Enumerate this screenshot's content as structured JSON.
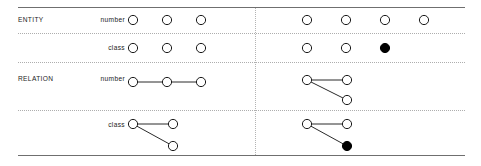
{
  "figure": {
    "width": 481,
    "height": 166,
    "background": "#ffffff",
    "line_color": "#6f6f6f",
    "separator_color": "#aeaeae",
    "node_stroke": "#1a1a1a",
    "node_fill_open": "#ffffff",
    "node_fill_closed": "#000000"
  },
  "rules": {
    "top": {
      "x": 18,
      "y": 7,
      "width": 447
    },
    "bottom": {
      "x": 18,
      "y": 155,
      "width": 447
    }
  },
  "separators": {
    "horizontal": [
      {
        "x": 18,
        "y": 33,
        "width": 447
      },
      {
        "x": 18,
        "y": 62,
        "width": 447
      },
      {
        "x": 18,
        "y": 110,
        "width": 447
      }
    ],
    "vertical": [
      {
        "x": 255,
        "y": 8,
        "height": 147
      }
    ]
  },
  "rows": [
    {
      "group_label": "ENTITY",
      "group_label_x": 18,
      "group_label_y": 17,
      "sub_label": "number",
      "sub_label_x": 80,
      "sub_label_y": 17,
      "sub_label_width": 45
    },
    {
      "group_label": "",
      "group_label_x": 18,
      "group_label_y": 45,
      "sub_label": "class",
      "sub_label_x": 80,
      "sub_label_y": 45,
      "sub_label_width": 45
    },
    {
      "group_label": "RELATION",
      "group_label_x": 18,
      "group_label_y": 76,
      "sub_label": "number",
      "sub_label_x": 80,
      "sub_label_y": 76,
      "sub_label_width": 45
    },
    {
      "group_label": "",
      "group_label_x": 18,
      "group_label_y": 122,
      "sub_label": "class",
      "sub_label_x": 80,
      "sub_label_y": 122,
      "sub_label_width": 45
    }
  ],
  "chart_data": {
    "type": "diagram",
    "title": "",
    "row_labels": [
      "ENTITY number",
      "ENTITY class",
      "RELATION number",
      "RELATION class"
    ],
    "column_labels": [
      "left",
      "right"
    ],
    "node_radius": 4.6,
    "cells": [
      {
        "row": "ENTITY number",
        "column": "left",
        "node_count": 3,
        "filled_count": 0,
        "edge_count": 0,
        "nodes": [
          {
            "cx": 133,
            "cy": 20,
            "filled": false
          },
          {
            "cx": 167,
            "cy": 20,
            "filled": false
          },
          {
            "cx": 201,
            "cy": 20,
            "filled": false
          }
        ],
        "edges": []
      },
      {
        "row": "ENTITY number",
        "column": "right",
        "node_count": 4,
        "filled_count": 0,
        "edge_count": 0,
        "nodes": [
          {
            "cx": 307,
            "cy": 20,
            "filled": false
          },
          {
            "cx": 346,
            "cy": 20,
            "filled": false
          },
          {
            "cx": 385,
            "cy": 20,
            "filled": false
          },
          {
            "cx": 424,
            "cy": 20,
            "filled": false
          }
        ],
        "edges": []
      },
      {
        "row": "ENTITY class",
        "column": "left",
        "node_count": 3,
        "filled_count": 0,
        "edge_count": 0,
        "nodes": [
          {
            "cx": 133,
            "cy": 48,
            "filled": false
          },
          {
            "cx": 167,
            "cy": 48,
            "filled": false
          },
          {
            "cx": 201,
            "cy": 48,
            "filled": false
          }
        ],
        "edges": []
      },
      {
        "row": "ENTITY class",
        "column": "right",
        "node_count": 3,
        "filled_count": 1,
        "edge_count": 0,
        "nodes": [
          {
            "cx": 307,
            "cy": 48,
            "filled": false
          },
          {
            "cx": 346,
            "cy": 48,
            "filled": false
          },
          {
            "cx": 385,
            "cy": 48,
            "filled": true
          }
        ],
        "edges": []
      },
      {
        "row": "RELATION number",
        "column": "left",
        "node_count": 3,
        "filled_count": 0,
        "edge_count": 2,
        "nodes": [
          {
            "cx": 133,
            "cy": 82,
            "filled": false
          },
          {
            "cx": 167,
            "cy": 82,
            "filled": false
          },
          {
            "cx": 201,
            "cy": 82,
            "filled": false
          }
        ],
        "edges": [
          {
            "from": 0,
            "to": 1
          },
          {
            "from": 1,
            "to": 2
          }
        ]
      },
      {
        "row": "RELATION number",
        "column": "right",
        "node_count": 3,
        "filled_count": 0,
        "edge_count": 2,
        "nodes": [
          {
            "cx": 307,
            "cy": 80,
            "filled": false
          },
          {
            "cx": 347,
            "cy": 80,
            "filled": false
          },
          {
            "cx": 347,
            "cy": 100,
            "filled": false
          }
        ],
        "edges": [
          {
            "from": 0,
            "to": 1
          },
          {
            "from": 0,
            "to": 2
          }
        ]
      },
      {
        "row": "RELATION class",
        "column": "left",
        "node_count": 3,
        "filled_count": 0,
        "edge_count": 2,
        "nodes": [
          {
            "cx": 133,
            "cy": 124,
            "filled": false
          },
          {
            "cx": 173,
            "cy": 124,
            "filled": false
          },
          {
            "cx": 173,
            "cy": 146,
            "filled": false
          }
        ],
        "edges": [
          {
            "from": 0,
            "to": 1
          },
          {
            "from": 0,
            "to": 2
          }
        ]
      },
      {
        "row": "RELATION class",
        "column": "right",
        "node_count": 3,
        "filled_count": 1,
        "edge_count": 2,
        "nodes": [
          {
            "cx": 307,
            "cy": 124,
            "filled": false
          },
          {
            "cx": 347,
            "cy": 124,
            "filled": false
          },
          {
            "cx": 347,
            "cy": 146,
            "filled": true
          }
        ],
        "edges": [
          {
            "from": 0,
            "to": 1
          },
          {
            "from": 0,
            "to": 2
          }
        ]
      }
    ]
  }
}
